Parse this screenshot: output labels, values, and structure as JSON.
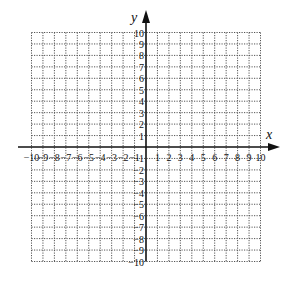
{
  "figure": {
    "type": "coordinate-plane",
    "x_axis": {
      "label": "x",
      "min": -10,
      "max": 10,
      "tick_labels": [
        "-10",
        "-9",
        "-8",
        "-7",
        "-6",
        "-5",
        "-4",
        "-3",
        "-2",
        "-1",
        "1",
        "2",
        "3",
        "4",
        "5",
        "6",
        "7",
        "8",
        "9",
        "10"
      ]
    },
    "y_axis": {
      "label": "y",
      "min": -10,
      "max": 10,
      "tick_labels": [
        "10",
        "9",
        "8",
        "7",
        "6",
        "5",
        "4",
        "3",
        "2",
        "1",
        "-1",
        "-2",
        "-3",
        "-4",
        "-5",
        "-6",
        "-7",
        "-8",
        "-9",
        "-10"
      ]
    },
    "grid": {
      "style": "dotted",
      "step": 1
    },
    "colors": {
      "axis": "#111111",
      "grid": "#555555",
      "background": "#ffffff"
    }
  }
}
